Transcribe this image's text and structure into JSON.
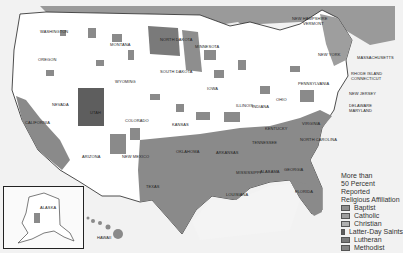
{
  "map": {
    "background": "#f2f2f2",
    "land_color": "#ffffff",
    "shaded_color": "#8a8a8a",
    "neighbor_land_color": "#9a9a9a",
    "state_labels": [
      {
        "name": "WASHINGTON",
        "x": 40,
        "y": 30
      },
      {
        "name": "OREGON",
        "x": 38,
        "y": 58
      },
      {
        "name": "MONTANA",
        "x": 110,
        "y": 43
      },
      {
        "name": "NORTH DAKOTA",
        "x": 160,
        "y": 38
      },
      {
        "name": "MINNESOTA",
        "x": 195,
        "y": 45
      },
      {
        "name": "WYOMING",
        "x": 115,
        "y": 80
      },
      {
        "name": "SOUTH DAKOTA",
        "x": 160,
        "y": 70
      },
      {
        "name": "IOWA",
        "x": 207,
        "y": 87
      },
      {
        "name": "NEVADA",
        "x": 52,
        "y": 103
      },
      {
        "name": "UTAH",
        "x": 90,
        "y": 111
      },
      {
        "name": "COLORADO",
        "x": 125,
        "y": 119
      },
      {
        "name": "KANSAS",
        "x": 172,
        "y": 123
      },
      {
        "name": "ILLINOIS",
        "x": 236,
        "y": 104
      },
      {
        "name": "INDIANA",
        "x": 252,
        "y": 105
      },
      {
        "name": "OHIO",
        "x": 276,
        "y": 98
      },
      {
        "name": "PENNSYLVANIA",
        "x": 298,
        "y": 82
      },
      {
        "name": "CALIFORNIA",
        "x": 25,
        "y": 121
      },
      {
        "name": "ARIZONA",
        "x": 82,
        "y": 155
      },
      {
        "name": "NEW MEXICO",
        "x": 122,
        "y": 155
      },
      {
        "name": "OKLAHOMA",
        "x": 176,
        "y": 150
      },
      {
        "name": "ARKANSAS",
        "x": 216,
        "y": 151
      },
      {
        "name": "TENNESSEE",
        "x": 252,
        "y": 141
      },
      {
        "name": "KENTUCKY",
        "x": 265,
        "y": 127
      },
      {
        "name": "VIRGINIA",
        "x": 302,
        "y": 122
      },
      {
        "name": "NORTH CAROLINA",
        "x": 300,
        "y": 138
      },
      {
        "name": "TEXAS",
        "x": 146,
        "y": 185
      },
      {
        "name": "MISSISSIPPI",
        "x": 236,
        "y": 171
      },
      {
        "name": "ALABAMA",
        "x": 260,
        "y": 170
      },
      {
        "name": "GEORGIA",
        "x": 284,
        "y": 168
      },
      {
        "name": "LOUISIANA",
        "x": 226,
        "y": 193
      },
      {
        "name": "FLORIDA",
        "x": 295,
        "y": 190
      },
      {
        "name": "NEW YORK",
        "x": 318,
        "y": 53
      }
    ],
    "callouts": [
      {
        "name": "NEW HAMPSHIRE",
        "x": 292,
        "y": 17
      },
      {
        "name": "VERMONT",
        "x": 303,
        "y": 22
      },
      {
        "name": "MASSACHUSETTS",
        "x": 357,
        "y": 56
      },
      {
        "name": "RHODE ISLAND",
        "x": 351,
        "y": 72
      },
      {
        "name": "CONNECTICUT",
        "x": 351,
        "y": 77
      },
      {
        "name": "NEW JERSEY",
        "x": 349,
        "y": 92
      },
      {
        "name": "DELAWARE",
        "x": 349,
        "y": 104
      },
      {
        "name": "MARYLAND",
        "x": 349,
        "y": 109
      }
    ],
    "inset_labels": [
      {
        "name": "ALASKA",
        "x": 40,
        "y": 206
      },
      {
        "name": "HAWAII",
        "x": 97,
        "y": 236
      }
    ]
  },
  "legend": {
    "title_lines": [
      "More than",
      "50 Percent Reported",
      "Religious Affiliation"
    ],
    "items": [
      {
        "label": "Baptist",
        "color": "#8e8e8e"
      },
      {
        "label": "Catholic",
        "color": "#9e9e9e"
      },
      {
        "label": "Christian",
        "color": "#b0b0b0"
      },
      {
        "label": "Latter-Day Saints",
        "color": "#5e5e5e"
      },
      {
        "label": "Lutheran",
        "color": "#7a7a7a"
      },
      {
        "label": "Methodist",
        "color": "#858585"
      }
    ]
  }
}
